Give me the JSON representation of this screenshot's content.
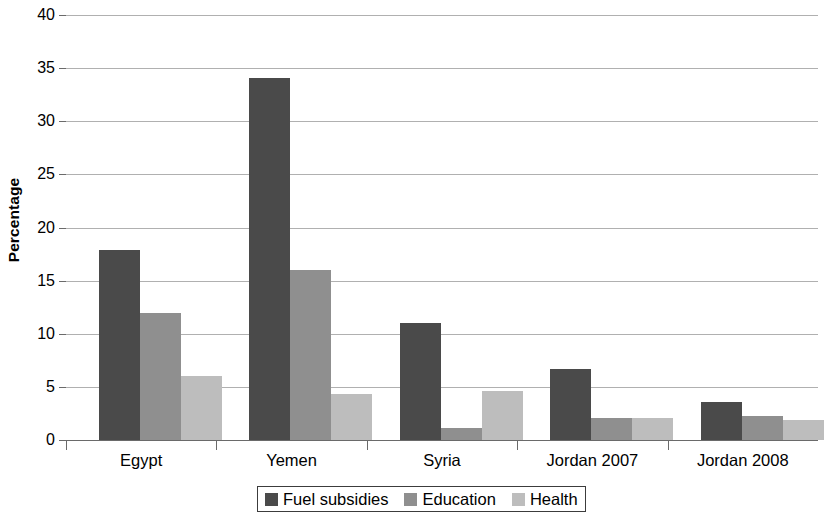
{
  "chart_data": {
    "type": "bar",
    "title": "",
    "subtitle": "",
    "xlabel": "",
    "ylabel": "Percentage",
    "ylim": [
      0,
      40
    ],
    "ytick_step": 5,
    "yticks": [
      0,
      5,
      10,
      15,
      20,
      25,
      30,
      35,
      40
    ],
    "ytick_labels": [
      "0",
      "5",
      "10",
      "15",
      "20",
      "25",
      "30",
      "35",
      "40"
    ],
    "grid": true,
    "grid_axis": "y",
    "legend_position": "bottom-center",
    "categories": [
      "Egypt",
      "Yemen",
      "Syria",
      "Jordan 2007",
      "Jordan 2008"
    ],
    "series": [
      {
        "name": "Fuel subsidies",
        "color": "#4a4a4a",
        "values": [
          17.9,
          34.1,
          11.0,
          6.7,
          3.6
        ]
      },
      {
        "name": "Education",
        "color": "#8f8f8f",
        "values": [
          12.0,
          16.0,
          1.1,
          2.1,
          2.3
        ]
      },
      {
        "name": "Health",
        "color": "#bdbdbd",
        "values": [
          6.0,
          4.3,
          4.6,
          2.1,
          1.9
        ]
      }
    ]
  },
  "axes": {
    "y_title": "Percentage"
  },
  "colors": {
    "series_1": "#4a4a4a",
    "series_2": "#8f8f8f",
    "series_3": "#bdbdbd",
    "gridline": "#b0b0b0",
    "axis": "#6a6a6a",
    "background": "#ffffff",
    "text": "#000000"
  }
}
